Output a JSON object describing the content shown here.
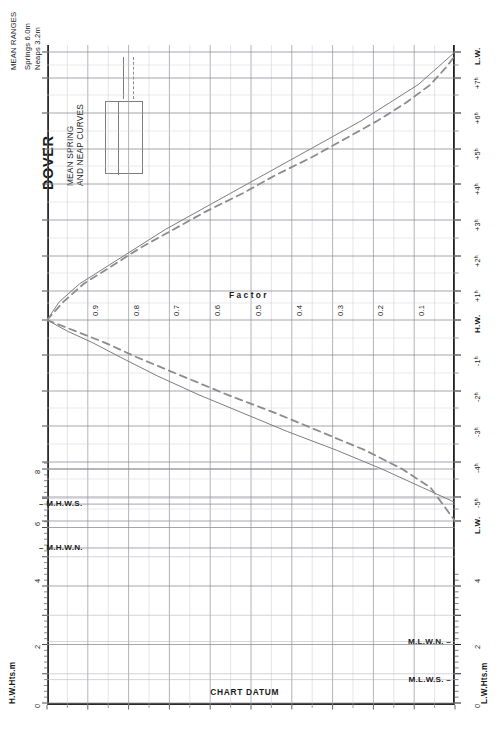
{
  "header": {
    "port_title": "DOVER",
    "subtitle_line1": "MEAN SPRING",
    "subtitle_line2": "AND NEAP CURVES"
  },
  "legend": {
    "box_title": "MEAN RANGES",
    "springs_label": "Springs  6.0m",
    "neaps_label": "Neaps    3.2m",
    "springs_style": "solid",
    "neaps_style": "dashed",
    "springs_color": "#7d7d7d",
    "neaps_color": "#8c8c8c"
  },
  "axes": {
    "factor_axis_title": "Factor",
    "factor_ticks": [
      "0.9",
      "0.8",
      "0.7",
      "0.6",
      "0.5",
      "0.4",
      "0.3",
      "0.2",
      "0.1"
    ],
    "left_axis_caption": "H.W.Hts.m",
    "right_axis_caption": "L.W.Hts.m",
    "left_height_ticks": [
      "8",
      "6",
      "4",
      "2",
      "0"
    ],
    "right_height_ticks": [
      "4",
      "2",
      "0"
    ],
    "time_ticks_upper": [
      "L.W.",
      "+7ʰ",
      "+6ʰ",
      "+5ʰ",
      "+4ʰ",
      "+3ʰ",
      "+2ʰ",
      "+1ʰ",
      "H.W."
    ],
    "time_ticks_lower": [
      "-1ʰ",
      "-2ʰ",
      "-3ʰ",
      "-4ʰ",
      "-5ʰ",
      "L.W."
    ],
    "chart_datum_label": "CHART DATUM"
  },
  "levels": {
    "mhws": "M.H.W.S.",
    "mhwn": "M.H.W.N.",
    "mlwn": "M.L.W.N.",
    "mlws": "M.L.W.S."
  },
  "chart_data": {
    "type": "line",
    "subtitle": "MEAN RANGES  Springs 6.0m   Neaps 3.2m",
    "xlabel": "Factor",
    "ylabel": "Time relative to High Water (hours)",
    "orientation": "factor on horizontal axis (1.0 at left, 0 at right); time on vertical right axis",
    "xlim": [
      1.0,
      0.0
    ],
    "grid": true,
    "legend_position": "top-left",
    "factor_tick_values": [
      0.9,
      0.8,
      0.7,
      0.6,
      0.5,
      0.4,
      0.3,
      0.2,
      0.1
    ],
    "time_axis_labels_top_to_bottom": [
      "L.W.",
      "+7ʰ",
      "+6ʰ",
      "+5ʰ",
      "+4ʰ",
      "+3ʰ",
      "+2ʰ",
      "+1ʰ",
      "H.W.",
      "-1ʰ",
      "-2ʰ",
      "-3ʰ",
      "-4ʰ",
      "-5ʰ",
      "L.W."
    ],
    "mean_ranges": {
      "springs_m": 6.0,
      "neaps_m": 3.2
    },
    "tidal_levels_m": {
      "MHWS": 6.8,
      "MHWN": 5.3,
      "MLWN": 2.1,
      "MLWS": 0.8
    },
    "height_axis": {
      "left_label": "H.W.Hts.m",
      "right_label": "L.W.Hts.m",
      "range_m": [
        0,
        8.6
      ],
      "major_ticks_m": [
        0,
        2,
        4,
        6,
        8
      ]
    },
    "series": [
      {
        "name": "Springs",
        "style": "solid",
        "comment": "falling limb H.W.->L.W. (hours after HW, factor)",
        "falling": [
          {
            "t": 0.0,
            "f": 1.0
          },
          {
            "t": 0.5,
            "f": 0.97
          },
          {
            "t": 1.0,
            "f": 0.92
          },
          {
            "t": 1.5,
            "f": 0.85
          },
          {
            "t": 2.0,
            "f": 0.78
          },
          {
            "t": 2.5,
            "f": 0.71
          },
          {
            "t": 3.0,
            "f": 0.63
          },
          {
            "t": 3.5,
            "f": 0.55
          },
          {
            "t": 4.0,
            "f": 0.47
          },
          {
            "t": 4.5,
            "f": 0.39
          },
          {
            "t": 5.0,
            "f": 0.31
          },
          {
            "t": 5.5,
            "f": 0.23
          },
          {
            "t": 6.0,
            "f": 0.16
          },
          {
            "t": 6.5,
            "f": 0.09
          },
          {
            "t": 7.0,
            "f": 0.04
          },
          {
            "t": 7.4,
            "f": 0.0
          }
        ],
        "rising": [
          {
            "t": 0.0,
            "f": 1.0
          },
          {
            "t": -0.3,
            "f": 0.95
          },
          {
            "t": -0.6,
            "f": 0.89
          },
          {
            "t": -1.0,
            "f": 0.82
          },
          {
            "t": -1.5,
            "f": 0.73
          },
          {
            "t": -2.0,
            "f": 0.63
          },
          {
            "t": -2.5,
            "f": 0.52
          },
          {
            "t": -3.0,
            "f": 0.41
          },
          {
            "t": -3.5,
            "f": 0.29
          },
          {
            "t": -4.0,
            "f": 0.18
          },
          {
            "t": -4.5,
            "f": 0.08
          },
          {
            "t": -4.9,
            "f": 0.0
          }
        ]
      },
      {
        "name": "Neaps",
        "style": "dashed",
        "comment": "falling limb H.W.->L.W. (hours after HW, factor)",
        "falling": [
          {
            "t": 0.0,
            "f": 1.0
          },
          {
            "t": 0.5,
            "f": 0.96
          },
          {
            "t": 1.0,
            "f": 0.91
          },
          {
            "t": 1.5,
            "f": 0.84
          },
          {
            "t": 2.0,
            "f": 0.77
          },
          {
            "t": 2.5,
            "f": 0.69
          },
          {
            "t": 3.0,
            "f": 0.61
          },
          {
            "t": 3.5,
            "f": 0.52
          },
          {
            "t": 4.0,
            "f": 0.44
          },
          {
            "t": 4.5,
            "f": 0.35
          },
          {
            "t": 5.0,
            "f": 0.27
          },
          {
            "t": 5.5,
            "f": 0.19
          },
          {
            "t": 6.0,
            "f": 0.12
          },
          {
            "t": 6.5,
            "f": 0.06
          },
          {
            "t": 7.0,
            "f": 0.02
          },
          {
            "t": 7.3,
            "f": 0.0
          }
        ],
        "rising": [
          {
            "t": 0.0,
            "f": 1.0
          },
          {
            "t": -0.3,
            "f": 0.93
          },
          {
            "t": -0.6,
            "f": 0.86
          },
          {
            "t": -1.0,
            "f": 0.78
          },
          {
            "t": -1.5,
            "f": 0.67
          },
          {
            "t": -2.0,
            "f": 0.56
          },
          {
            "t": -2.5,
            "f": 0.44
          },
          {
            "t": -3.0,
            "f": 0.33
          },
          {
            "t": -3.5,
            "f": 0.22
          },
          {
            "t": -4.0,
            "f": 0.13
          },
          {
            "t": -4.5,
            "f": 0.06
          },
          {
            "t": -5.4,
            "f": 0.0
          }
        ]
      }
    ]
  }
}
